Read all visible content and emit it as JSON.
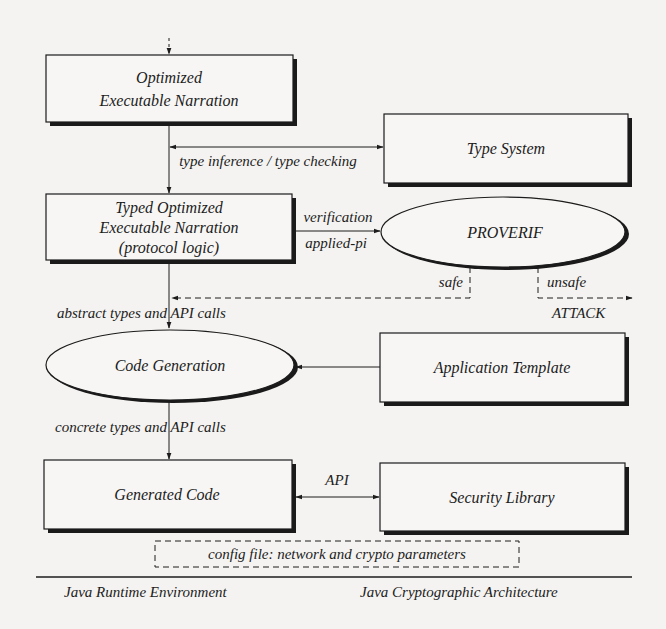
{
  "nodes": {
    "optimized_narration": {
      "lines": [
        "Optimized",
        "Executable Narration"
      ],
      "shape": "box"
    },
    "type_system": {
      "lines": [
        "Type System"
      ],
      "shape": "box"
    },
    "typed_narration": {
      "lines": [
        "Typed Optimized",
        "Executable Narration",
        "(protocol logic)"
      ],
      "shape": "box"
    },
    "proverif": {
      "lines": [
        "PROVERIF"
      ],
      "shape": "ellipse"
    },
    "code_generation": {
      "lines": [
        "Code Generation"
      ],
      "shape": "ellipse"
    },
    "application_template": {
      "lines": [
        "Application Template"
      ],
      "shape": "box"
    },
    "generated_code": {
      "lines": [
        "Generated Code"
      ],
      "shape": "box"
    },
    "security_library": {
      "lines": [
        "Security Library"
      ],
      "shape": "box"
    },
    "config_file": {
      "lines": [
        "config file: network and crypto parameters"
      ],
      "shape": "dashed-box"
    }
  },
  "edges": {
    "type_inference": "type inference / type checking",
    "verification": "verification",
    "applied_pi": "applied-pi",
    "safe": "safe",
    "unsafe": "unsafe",
    "attack": "ATTACK",
    "abstract_types": "abstract types and API calls",
    "concrete_types": "concrete types and API calls",
    "api": "API"
  },
  "footer": {
    "left": "Java Runtime Environment",
    "right": "Java Cryptographic Architecture"
  },
  "colors": {
    "background": "#f4f3f1",
    "ink": "#1c1c1c",
    "shadow": "#1a1a1a"
  }
}
